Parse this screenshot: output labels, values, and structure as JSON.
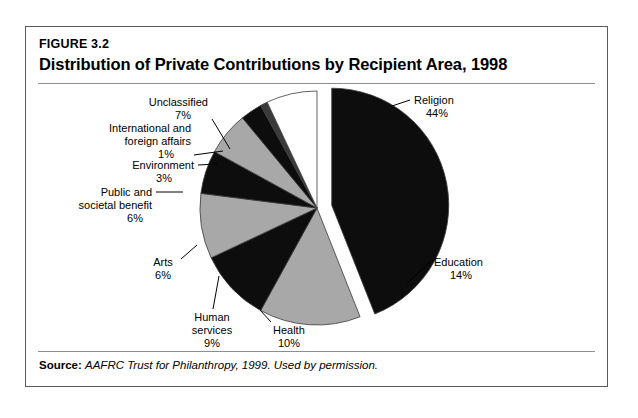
{
  "figure": {
    "number": "FIGURE 3.2",
    "title": "Distribution of Private Contributions by Recipient Area, 1998",
    "source_label": "Source:",
    "source_text": "AAFRC Trust for Philanthropy, 1999. Used by permission."
  },
  "colors": {
    "black": "#0d0d0d",
    "gray": "#a8a8a8",
    "white": "#ffffff",
    "outline": "#3a3a3a",
    "frame": "#5a5a5a",
    "rule": "#8d8d8d"
  },
  "chart_data": {
    "type": "pie",
    "title": "Distribution of Private Contributions by Recipient Area, 1998",
    "units": "percent",
    "legend": "none",
    "exploded_slice": "Religion",
    "categories": [
      "Religion",
      "Education",
      "Health",
      "Human services",
      "Arts",
      "Public and societal benefit",
      "Environment",
      "International and foreign affairs",
      "Unclassified"
    ],
    "values": [
      44,
      14,
      10,
      9,
      6,
      6,
      3,
      1,
      7
    ],
    "slices": [
      {
        "label": "Religion",
        "label_line1": "Religion",
        "label_line2": "44%",
        "value": 44,
        "percent_text": "44%",
        "fill": "#0d0d0d"
      },
      {
        "label": "Education",
        "label_line1": "Education",
        "label_line2": "14%",
        "value": 14,
        "percent_text": "14%",
        "fill": "#a8a8a8"
      },
      {
        "label": "Health",
        "label_line1": "Health",
        "label_line2": "10%",
        "value": 10,
        "percent_text": "10%",
        "fill": "#0d0d0d"
      },
      {
        "label": "Human services",
        "label_line1": "Human",
        "label_line2": "services",
        "label_line3": "9%",
        "value": 9,
        "percent_text": "9%",
        "fill": "#a8a8a8"
      },
      {
        "label": "Arts",
        "label_line1": "Arts",
        "label_line2": "6%",
        "value": 6,
        "percent_text": "6%",
        "fill": "#0d0d0d"
      },
      {
        "label": "Public and societal benefit",
        "label_line1": "Public and",
        "label_line2": "societal benefit",
        "label_line3": "6%",
        "value": 6,
        "percent_text": "6%",
        "fill": "#a8a8a8"
      },
      {
        "label": "Environment",
        "label_line1": "Environment",
        "label_line2": "3%",
        "value": 3,
        "percent_text": "3%",
        "fill": "#0d0d0d"
      },
      {
        "label": "International and foreign affairs",
        "label_line1": "International and",
        "label_line2": "foreign affairs",
        "label_line3": "1%",
        "value": 1,
        "percent_text": "1%",
        "fill": "#3a3a3a"
      },
      {
        "label": "Unclassified",
        "label_line1": "Unclassified",
        "label_line2": "7%",
        "value": 7,
        "percent_text": "7%",
        "fill": "#ffffff"
      }
    ]
  }
}
